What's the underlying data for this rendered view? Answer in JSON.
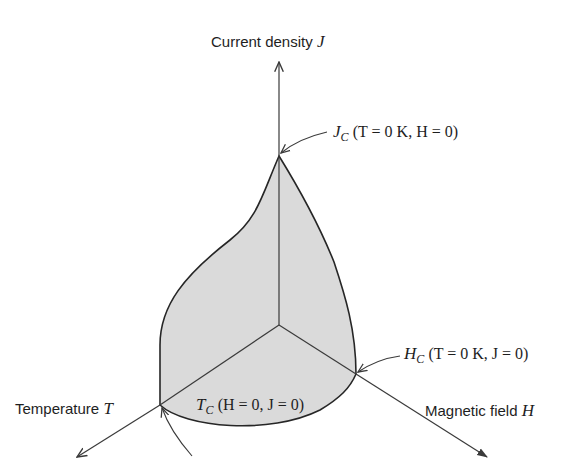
{
  "diagram": {
    "type": "3D critical surface of a superconductor",
    "axes": {
      "j": {
        "label": "Current density",
        "symbol": "J"
      },
      "t": {
        "label": "Temperature",
        "symbol": "T"
      },
      "h": {
        "label": "Magnetic field",
        "symbol": "H"
      }
    },
    "annotations": {
      "jc": {
        "symbol": "J",
        "sub": "C",
        "cond": "(T = 0 K, H = 0)"
      },
      "hc": {
        "symbol": "H",
        "sub": "C",
        "cond": "(T = 0 K, J = 0)"
      },
      "tc": {
        "symbol": "T",
        "sub": "C",
        "cond": "(H = 0, J = 0)"
      }
    },
    "colors": {
      "surface_fill": "#d9d9d9",
      "line": "#2a2a2a",
      "axis": "#4a4a4a"
    }
  }
}
